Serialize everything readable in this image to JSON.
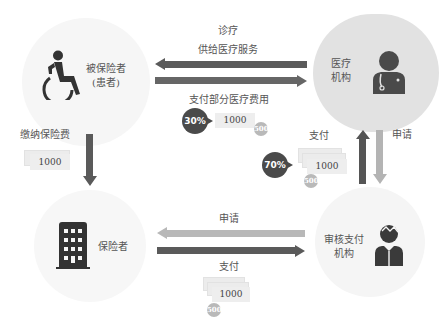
{
  "nodes": {
    "patient": {
      "label_line1": "被保险者",
      "label_line2": "(患者)",
      "icon": "wheelchair-icon"
    },
    "medical": {
      "label_line1": "医疗",
      "label_line2": "机构",
      "icon": "doctor-icon"
    },
    "insurer": {
      "label": "保险者",
      "icon": "building-icon"
    },
    "review": {
      "label_line1": "审核支付",
      "label_line2": "机构",
      "icon": "reviewer-person-icon"
    }
  },
  "flows": {
    "treatment": {
      "line1": "诊疗",
      "line2": "供给医疗服务"
    },
    "partial_payment": {
      "label": "支付部分医疗费用",
      "percent": "30%",
      "bill": "1000",
      "coin": "500"
    },
    "premium": {
      "label": "缴纳保险费",
      "bill": "1000"
    },
    "review_payment": {
      "label": "支付",
      "percent": "70%",
      "bill": "1000",
      "coin": "500"
    },
    "apply_right": {
      "label": "申请"
    },
    "apply_bottom": {
      "label": "申请"
    },
    "pay_bottom": {
      "label": "支付",
      "bill": "1000",
      "coin": "500"
    }
  },
  "colors": {
    "dark_arrow": "#5a5a5a",
    "light_arrow": "#b4b4b4",
    "circle_light": "#f4f4f4",
    "circle_medical": "#e3e3e3",
    "icon_dark": "#3a3a3a"
  }
}
